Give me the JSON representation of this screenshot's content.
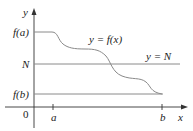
{
  "diagram": {
    "axes": {
      "x_label": "x",
      "y_label": "y",
      "origin_label": "0"
    },
    "ticks": {
      "x": [
        "a",
        "b"
      ],
      "y": [
        "f(a)",
        "N",
        "f(b)"
      ]
    },
    "curve_label": "y = f(x)",
    "line_label": "y = N",
    "colors": {
      "curve": "#8a8a8a",
      "lines": "#8a8a8a",
      "axes": "#333333",
      "text": "#222222"
    }
  }
}
